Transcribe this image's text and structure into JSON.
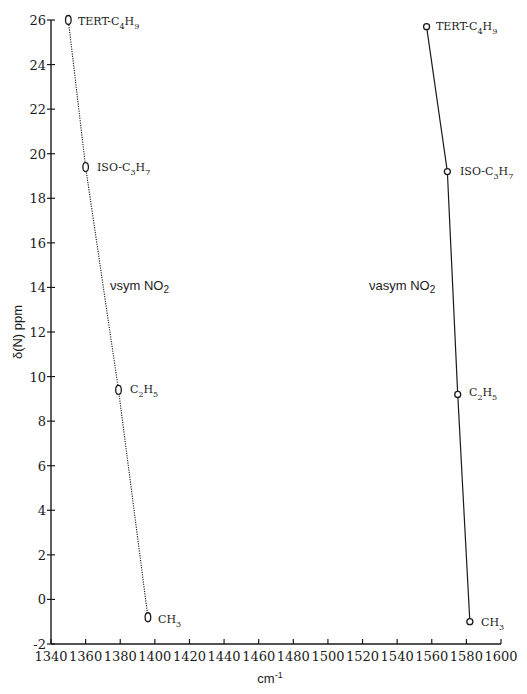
{
  "chart_data": {
    "type": "line",
    "title": "",
    "xlabel": "cm-1",
    "ylabel": "δ(N) ppm",
    "xlim": [
      1340,
      1600
    ],
    "ylim": [
      -2,
      26
    ],
    "x_ticks": [
      1340,
      1360,
      1380,
      1400,
      1420,
      1440,
      1460,
      1480,
      1500,
      1520,
      1540,
      1560,
      1580,
      1600
    ],
    "y_ticks": [
      -2,
      0,
      2,
      4,
      6,
      8,
      10,
      12,
      14,
      16,
      18,
      20,
      22,
      24,
      26
    ],
    "grid": false,
    "legend": "none (series labeled inline)",
    "series": [
      {
        "name": "νsym NO2",
        "line_style": "dotted",
        "marker": "open-oval",
        "points": [
          {
            "label": "TERT-C4H9",
            "x": 1350,
            "y": 26.0
          },
          {
            "label": "ISO-C3H7",
            "x": 1360,
            "y": 19.4
          },
          {
            "label": "C2H5",
            "x": 1379,
            "y": 9.4
          },
          {
            "label": "CH3",
            "x": 1396,
            "y": -0.8
          }
        ]
      },
      {
        "name": "νasym NO2",
        "line_style": "solid",
        "marker": "open-circle",
        "points": [
          {
            "label": "TERT-C4H9",
            "x": 1557,
            "y": 25.7
          },
          {
            "label": "ISO-C3H7",
            "x": 1569,
            "y": 19.2
          },
          {
            "label": "C2H5",
            "x": 1575,
            "y": 9.2
          },
          {
            "label": "CH3",
            "x": 1582,
            "y": -1.0
          }
        ]
      }
    ]
  },
  "labels": {
    "ylabel_text": "δ(N) ppm",
    "xlabel_base": "cm",
    "xlabel_sup": "-1",
    "sym_series_prefix": "νsym NO",
    "sym_series_sub": "2",
    "asym_series_prefix": "νasym NO",
    "asym_series_sub": "2",
    "compounds": {
      "tert": {
        "base1": "TERT-C",
        "sub1": "4",
        "base2": "H",
        "sub2": "9"
      },
      "iso": {
        "base1": "ISO-C",
        "sub1": "3",
        "base2": "H",
        "sub2": "7"
      },
      "ethyl": {
        "base1": "C",
        "sub1": "2",
        "base2": "H",
        "sub2": "5"
      },
      "methyl": {
        "base1": "CH",
        "sub1": "3"
      }
    }
  }
}
